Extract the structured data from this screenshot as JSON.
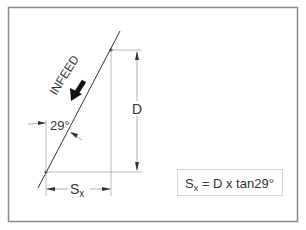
{
  "diagram": {
    "infeed_label": "INFEED",
    "angle_label": "29°",
    "depth_label": "D",
    "offset_label_main": "S",
    "offset_label_sub": "x",
    "formula": {
      "lhs_main": "S",
      "lhs_sub": "x",
      "rhs": " = D x tan29°"
    },
    "colors": {
      "line": "#333333",
      "dim_line": "#aaaaaa",
      "frame": "#8a8a8a",
      "formula_border": "#d6d6d6",
      "arrow": "#111111"
    }
  }
}
